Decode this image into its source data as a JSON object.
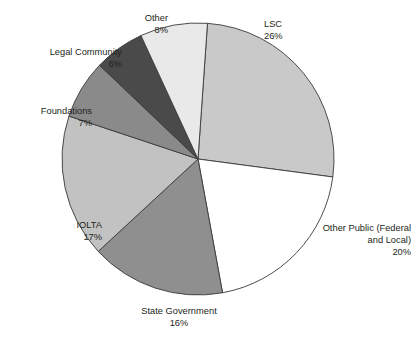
{
  "chart_data": {
    "type": "pie",
    "title": "",
    "xlabel": "",
    "ylabel": "",
    "legend_position": "none",
    "grid": false,
    "labels_show_percent": true,
    "start_angle_deg": 4,
    "direction": "clockwise",
    "categories": [
      "LSC",
      "Other Public (Federal and Local)",
      "State Government",
      "IOLTA",
      "Foundations",
      "Legal Community",
      "Other"
    ],
    "values": [
      26,
      20,
      16,
      17,
      7,
      6,
      8
    ],
    "units": "percent",
    "colors": [
      "#c9c9c9",
      "#ffffff",
      "#8f8f8f",
      "#c2c2c2",
      "#8a8a8a",
      "#4a4a4a",
      "#e9e9e9"
    ],
    "slices": [
      {
        "name": "LSC",
        "value": 26,
        "percent_label": "26%",
        "color": "#c9c9c9"
      },
      {
        "name": "Other Public (Federal and Local)",
        "value": 20,
        "percent_label": "20%",
        "color": "#ffffff"
      },
      {
        "name": "State Government",
        "value": 16,
        "percent_label": "16%",
        "color": "#8f8f8f"
      },
      {
        "name": "IOLTA",
        "value": 17,
        "percent_label": "17%",
        "color": "#c2c2c2"
      },
      {
        "name": "Foundations",
        "value": 7,
        "percent_label": "7%",
        "color": "#8a8a8a"
      },
      {
        "name": "Legal Community",
        "value": 6,
        "percent_label": "6%",
        "color": "#4a4a4a"
      },
      {
        "name": "Other",
        "value": 8,
        "percent_label": "8%",
        "color": "#e9e9e9"
      }
    ]
  },
  "labels": {
    "lsc": {
      "name": "LSC",
      "percent": "26%"
    },
    "other_public": {
      "name_line1": "Other Public (Federal",
      "name_line2": "and Local)",
      "percent": "20%"
    },
    "state": {
      "name": "State Government",
      "percent": "16%"
    },
    "iolta": {
      "name": "IOLTA",
      "percent": "17%"
    },
    "foundations": {
      "name": "Foundations",
      "percent": "7%"
    },
    "legal": {
      "name": "Legal Community",
      "percent": "6%"
    },
    "other": {
      "name": "Other",
      "percent": "8%"
    }
  },
  "geometry": {
    "center_x": 198,
    "center_y": 159,
    "radius": 136
  },
  "style": {
    "stroke": "#3a3a3a",
    "background": "#ffffff",
    "text_color": "#231f20"
  }
}
